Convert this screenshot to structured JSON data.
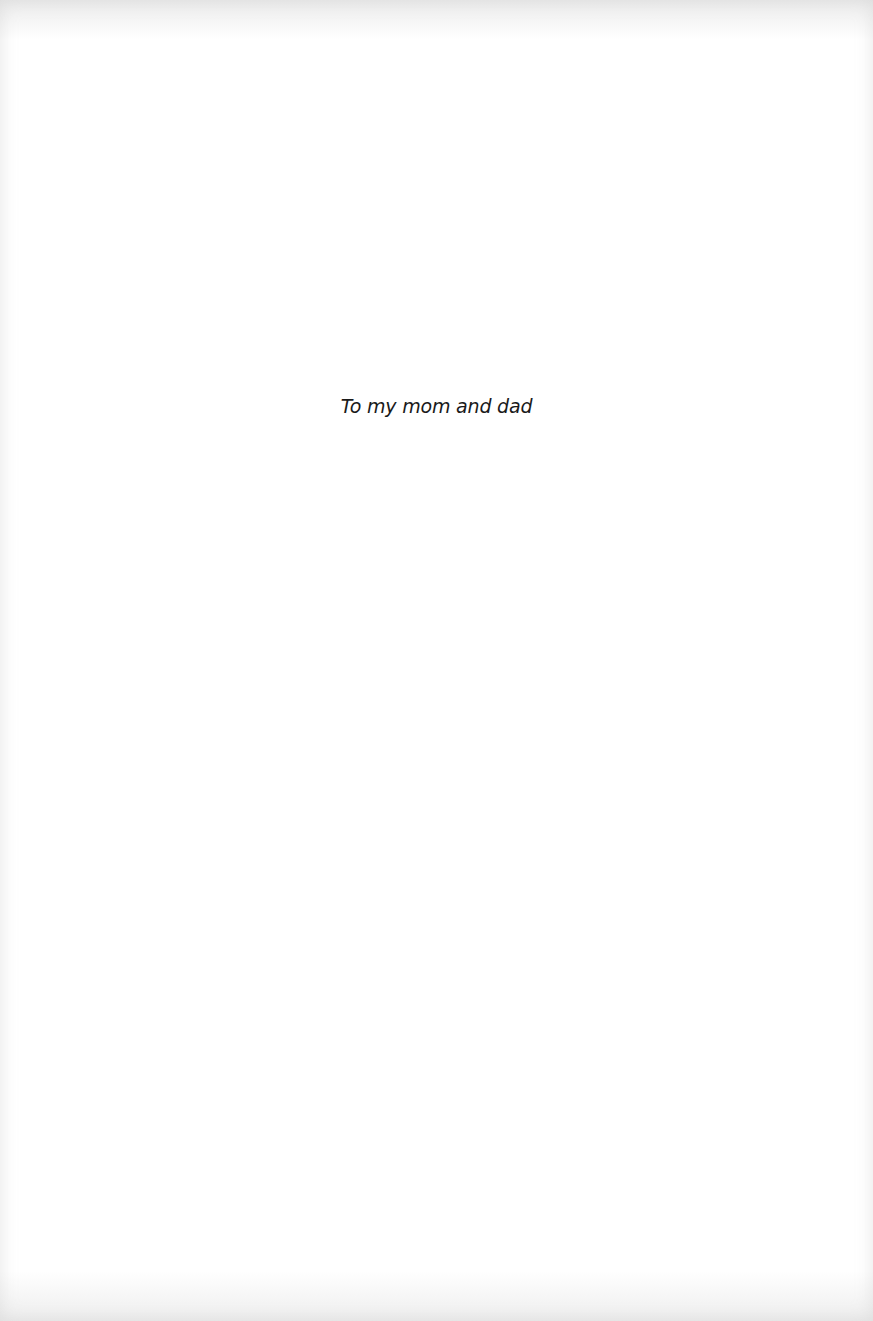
{
  "page": {
    "type": "dedication",
    "text": "To my mom and dad"
  }
}
